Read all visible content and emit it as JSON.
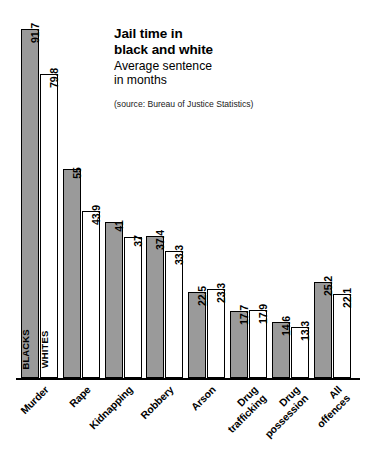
{
  "header": {
    "title_line1": "Jail time in",
    "title_line2": "black and white",
    "subtitle_line1": "Average sentence",
    "subtitle_line2": "in months",
    "source": "(source: Bureau of Justice Statistics)"
  },
  "legend": {
    "series_blacks_label": "BLACKS",
    "series_whites_label": "WHITES"
  },
  "colors": {
    "blacks_fill": "#9a9a9a",
    "whites_fill": "#ffffff",
    "outline": "#000000"
  },
  "chart_data": {
    "type": "bar",
    "title": "Jail time in black and white",
    "subtitle": "Average sentence in months",
    "source": "(source: Bureau of Justice Statistics)",
    "xlabel": "",
    "ylabel": "Average sentence in months",
    "ylim": [
      0,
      91.7
    ],
    "grid": false,
    "legend_position": "in-first-bar-pair",
    "orientation": "vertical",
    "grouped": true,
    "categories": [
      "Murder",
      "Rape",
      "Kidnapping",
      "Robbery",
      "Arson",
      "Drug trafficking",
      "Drug possession",
      "All offences"
    ],
    "category_label_lines": [
      [
        "Murder"
      ],
      [
        "Rape"
      ],
      [
        "Kidnapping"
      ],
      [
        "Robbery"
      ],
      [
        "Arson"
      ],
      [
        "Drug",
        "trafficking"
      ],
      [
        "Drug",
        "possession"
      ],
      [
        "All",
        "offences"
      ]
    ],
    "series": [
      {
        "name": "BLACKS",
        "color": "#9a9a9a",
        "values": [
          91.7,
          55,
          41,
          37.4,
          22.5,
          17.7,
          14.6,
          25.2
        ],
        "value_labels": [
          "91.7",
          "55",
          "41",
          "37.4",
          "22.5",
          "17.7",
          "14.6",
          "25.2"
        ]
      },
      {
        "name": "WHITES",
        "color": "#ffffff",
        "values": [
          79.8,
          43.9,
          37,
          33.3,
          23.3,
          17.9,
          13.3,
          22.1
        ],
        "value_labels": [
          "79.8",
          "43.9",
          "37",
          "33.3",
          "23.3",
          "17.9",
          "13.3",
          "22.1"
        ]
      }
    ]
  }
}
